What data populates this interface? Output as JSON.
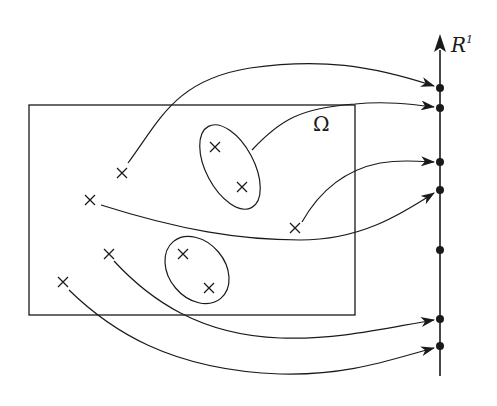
{
  "diagram": {
    "axis": {
      "label": "R",
      "superscript": "1",
      "x": 440,
      "y_top": 35,
      "y_bottom": 376
    },
    "region_label": "Ω",
    "rectangle": {
      "x": 29,
      "y": 105,
      "width": 326,
      "height": 210
    },
    "points": [
      {
        "id": "p1",
        "x": 122,
        "y": 173
      },
      {
        "id": "p2",
        "x": 90,
        "y": 200
      },
      {
        "id": "p3",
        "x": 215,
        "y": 147
      },
      {
        "id": "p4",
        "x": 242,
        "y": 187
      },
      {
        "id": "p5",
        "x": 295,
        "y": 228
      },
      {
        "id": "p6",
        "x": 109,
        "y": 254
      },
      {
        "id": "p7",
        "x": 183,
        "y": 254
      },
      {
        "id": "p8",
        "x": 209,
        "y": 288
      },
      {
        "id": "p9",
        "x": 63,
        "y": 282
      }
    ],
    "axis_dots": [
      88,
      108,
      162,
      190,
      250,
      319,
      346
    ],
    "colors": {
      "stroke": "#1a1a1a",
      "background": "#ffffff"
    }
  }
}
